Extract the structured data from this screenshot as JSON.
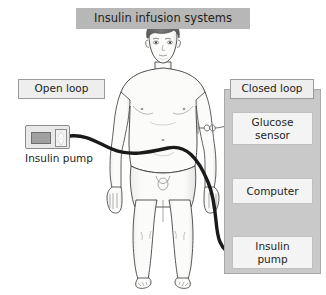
{
  "figure": {
    "title": "Insulin infusion systems",
    "width": 326,
    "height": 295,
    "background": "#ffffff"
  },
  "open_loop": {
    "heading": "Open loop",
    "device": {
      "name": "Insulin pump",
      "screen": "screen-display",
      "button_up": "up-arrow",
      "button_down": "down-arrow"
    }
  },
  "closed_loop": {
    "heading": "Closed loop",
    "panel_color": "#c9c9c9",
    "boxes": [
      {
        "label": "Glucose\nsensor",
        "line1": "Glucose",
        "line2": "sensor"
      },
      {
        "label": "Computer",
        "line1": "Computer",
        "line2": ""
      },
      {
        "label": "Insulin\npump",
        "line1": "Insulin",
        "line2": "pump"
      }
    ],
    "arrows": [
      {
        "from": "Glucose sensor",
        "to": "Computer"
      },
      {
        "from": "Computer",
        "to": "Insulin pump"
      }
    ]
  },
  "body_figure": {
    "name": "human-body-front-view",
    "hair_color": "#6b6b6b",
    "skin_color": "#fbfbfa",
    "outline_color": "#3a3a3a"
  },
  "connections": {
    "infusion_tube": {
      "name": "insulin-infusion-tube",
      "color": "#1a1a1a",
      "from": "Insulin pump (open loop)",
      "to": "Insulin pump (closed loop)"
    },
    "sensor_wire": {
      "name": "glucose-sensor-wire",
      "color": "#6f6f6f",
      "from": "abdomen",
      "to": "Glucose sensor"
    }
  },
  "colors": {
    "title_bg": "#b7b7b7",
    "chip_bg": "#eeeeee",
    "box_bg": "#f4f4f4",
    "text": "#231f20"
  }
}
